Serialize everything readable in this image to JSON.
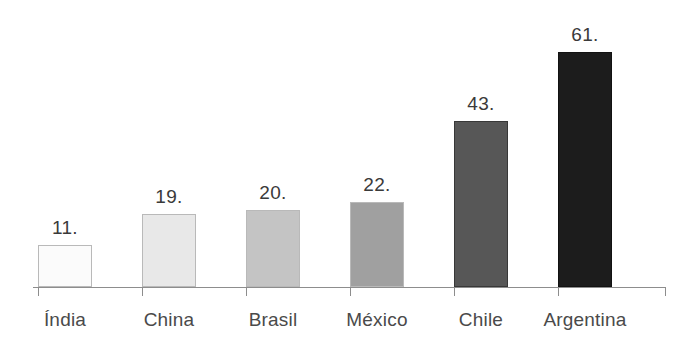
{
  "chart_data": {
    "type": "bar",
    "title": "",
    "subtitle": "",
    "xlabel": "",
    "ylabel": "",
    "grid": false,
    "legend": null,
    "axis": {
      "x_axis_visible": true,
      "y_axis_visible": false,
      "ticks_below_axis": true
    },
    "ylim": [
      0,
      61
    ],
    "categories": [
      "Índia",
      "China",
      "Brasil",
      "México",
      "Chile",
      "Argentina"
    ],
    "values": [
      11,
      19,
      20,
      22,
      43,
      61
    ],
    "data_labels": [
      "11.",
      "19.",
      "20.",
      "22.",
      "43.",
      "61."
    ],
    "bar_colors": [
      "#fbfbfb",
      "#e8e8e8",
      "#c4c4c4",
      "#a0a0a0",
      "#575757",
      "#1c1c1c"
    ],
    "bar_border_color": "#b9b9b9",
    "axis_color": "#8d8d8d",
    "background_color": "#ffffff",
    "label_color": "#3a3a3a",
    "bars": [
      {
        "category": "Índia",
        "value": 11,
        "label": "11.",
        "color": "#fbfbfb",
        "shade": "light"
      },
      {
        "category": "China",
        "value": 19,
        "label": "19.",
        "color": "#e8e8e8",
        "shade": "light"
      },
      {
        "category": "Brasil",
        "value": 20,
        "label": "20.",
        "color": "#c4c4c4",
        "shade": "light"
      },
      {
        "category": "México",
        "value": 22,
        "label": "22.",
        "color": "#a0a0a0",
        "shade": "mid"
      },
      {
        "category": "Chile",
        "value": 43,
        "label": "43.",
        "color": "#575757",
        "shade": "dark"
      },
      {
        "category": "Argentina",
        "value": 61,
        "label": "61.",
        "color": "#1c1c1c",
        "shade": "dark"
      }
    ]
  }
}
